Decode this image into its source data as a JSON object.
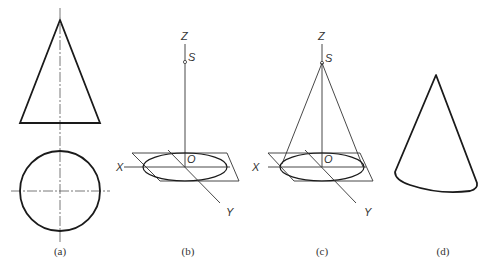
{
  "figure": {
    "panels": [
      {
        "id": "a",
        "caption": "(a)",
        "description": "orthographic views of cone: triangle front view and circle top view with center lines"
      },
      {
        "id": "b",
        "caption": "(b)",
        "description": "axes with base ellipse in XY plane and apex S on Z axis",
        "labels": {
          "z": "Z",
          "s": "S",
          "o": "O",
          "x": "X",
          "y": "Y"
        }
      },
      {
        "id": "c",
        "caption": "(c)",
        "description": "cone constructed from apex S to base ellipse",
        "labels": {
          "z": "Z",
          "s": "S",
          "o": "O",
          "x": "X",
          "y": "Y"
        }
      },
      {
        "id": "d",
        "caption": "(d)",
        "description": "finished pictorial cone"
      }
    ]
  },
  "colors": {
    "line": "#1a1a1a",
    "thin": "#333333",
    "background": "#ffffff"
  }
}
